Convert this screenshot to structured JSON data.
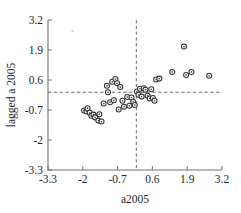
{
  "chart_data": {
    "type": "scatter",
    "title": "",
    "xlabel": "a2005",
    "ylabel": "lagged a 2005",
    "xlim": [
      -3.3,
      3.2
    ],
    "ylim": [
      -3.3,
      3.2
    ],
    "grid": false,
    "legend": null,
    "x_ticks": [
      -3.3,
      -2,
      -0.7,
      0.6,
      1.9,
      3.2
    ],
    "x_tick_labels": [
      "-3.3",
      "-2",
      "-0.7",
      "0.6",
      "1.9",
      "3.2"
    ],
    "y_ticks": [
      -3.3,
      -2,
      -0.7,
      0.6,
      1.9,
      3.2
    ],
    "y_tick_labels": [
      "-3.3",
      "-2",
      "-0.7",
      "0.6",
      "1.9",
      "3.2"
    ],
    "reference_lines": {
      "vertical_x": 0.0,
      "horizontal_y": 0.07,
      "style": "dashed"
    },
    "marker_style": "open-circle",
    "points": [
      {
        "x": -1.95,
        "y": -0.72
      },
      {
        "x": -1.86,
        "y": -0.76
      },
      {
        "x": -1.82,
        "y": -0.62
      },
      {
        "x": -1.74,
        "y": -0.82
      },
      {
        "x": -1.68,
        "y": -0.95
      },
      {
        "x": -1.6,
        "y": -0.9
      },
      {
        "x": -1.54,
        "y": -1.02
      },
      {
        "x": -1.42,
        "y": -1.16
      },
      {
        "x": -1.38,
        "y": -0.88
      },
      {
        "x": -1.3,
        "y": -1.2
      },
      {
        "x": -1.22,
        "y": -0.42
      },
      {
        "x": -1.1,
        "y": 0.35
      },
      {
        "x": -1.06,
        "y": 0.07
      },
      {
        "x": -0.98,
        "y": -0.36
      },
      {
        "x": -0.9,
        "y": 0.52
      },
      {
        "x": -0.84,
        "y": -0.28
      },
      {
        "x": -0.78,
        "y": 0.64
      },
      {
        "x": -0.72,
        "y": 0.46
      },
      {
        "x": -0.66,
        "y": -0.68
      },
      {
        "x": -0.6,
        "y": 0.3
      },
      {
        "x": -0.52,
        "y": -0.3
      },
      {
        "x": -0.46,
        "y": -0.56
      },
      {
        "x": -0.34,
        "y": -0.14
      },
      {
        "x": -0.26,
        "y": -0.52
      },
      {
        "x": -0.18,
        "y": -0.16
      },
      {
        "x": -0.12,
        "y": -0.34
      },
      {
        "x": -0.06,
        "y": -0.48
      },
      {
        "x": 0.02,
        "y": 0.1
      },
      {
        "x": 0.08,
        "y": -0.04
      },
      {
        "x": 0.14,
        "y": 0.22
      },
      {
        "x": 0.2,
        "y": -0.12
      },
      {
        "x": 0.28,
        "y": 0.24
      },
      {
        "x": 0.34,
        "y": 0.18
      },
      {
        "x": 0.42,
        "y": -0.08
      },
      {
        "x": 0.5,
        "y": -0.2
      },
      {
        "x": 0.56,
        "y": 0.2
      },
      {
        "x": 0.62,
        "y": -0.18
      },
      {
        "x": 0.68,
        "y": -0.3
      },
      {
        "x": 0.74,
        "y": 0.62
      },
      {
        "x": 0.86,
        "y": 0.66
      },
      {
        "x": 1.34,
        "y": 0.95
      },
      {
        "x": 1.78,
        "y": 2.05
      },
      {
        "x": 1.86,
        "y": 0.82
      },
      {
        "x": 2.06,
        "y": 0.95
      },
      {
        "x": 2.72,
        "y": 0.78
      }
    ]
  },
  "axes": {
    "x_title": "a2005",
    "y_title": "lagged a 2005"
  }
}
